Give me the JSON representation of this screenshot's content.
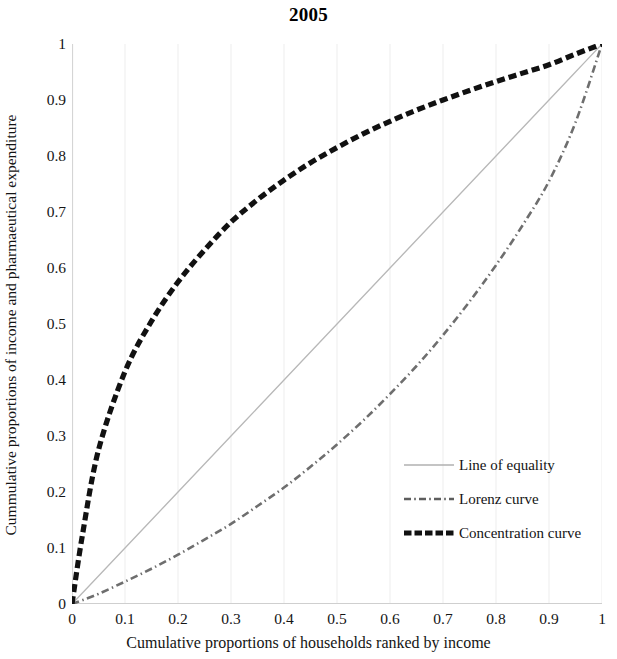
{
  "chart_data": {
    "type": "line",
    "title": "2005",
    "xlabel": "Cumulative  proportions of households ranked by income",
    "ylabel": "Cummulative proportions of income and pharmaeutical expenditure",
    "xlim": [
      0,
      1
    ],
    "ylim": [
      0,
      1
    ],
    "grid": true,
    "legend_position": "inside-lower-right",
    "xticks": [
      "0",
      "0.1",
      "0.2",
      "0.3",
      "0.4",
      "0.5",
      "0.6",
      "0.7",
      "0.8",
      "0.9",
      "1"
    ],
    "yticks": [
      "0",
      "0.1",
      "0.2",
      "0.3",
      "0.4",
      "0.5",
      "0.6",
      "0.7",
      "0.8",
      "0.9",
      "1"
    ],
    "x": [
      0,
      0.02,
      0.05,
      0.1,
      0.15,
      0.2,
      0.25,
      0.3,
      0.35,
      0.4,
      0.45,
      0.5,
      0.55,
      0.6,
      0.65,
      0.7,
      0.75,
      0.8,
      0.85,
      0.9,
      0.95,
      1
    ],
    "series": [
      {
        "name": "Line of equality",
        "style": "solid",
        "color": "#b8b8b8",
        "width": 1.3,
        "values": [
          0,
          0.02,
          0.05,
          0.1,
          0.15,
          0.2,
          0.25,
          0.3,
          0.35,
          0.4,
          0.45,
          0.5,
          0.55,
          0.6,
          0.65,
          0.7,
          0.75,
          0.8,
          0.85,
          0.9,
          0.95,
          1
        ]
      },
      {
        "name": "Lorenz curve",
        "style": "dash-dot",
        "color": "#6e6e6e",
        "width": 2.6,
        "values": [
          0,
          0.007,
          0.018,
          0.04,
          0.063,
          0.088,
          0.115,
          0.143,
          0.175,
          0.208,
          0.245,
          0.285,
          0.328,
          0.375,
          0.425,
          0.48,
          0.54,
          0.605,
          0.676,
          0.755,
          0.86,
          1
        ]
      },
      {
        "name": "Concentration curve",
        "style": "dashed",
        "color": "#111111",
        "width": 5.2,
        "values": [
          0,
          0.125,
          0.275,
          0.415,
          0.505,
          0.575,
          0.632,
          0.682,
          0.722,
          0.757,
          0.788,
          0.815,
          0.84,
          0.862,
          0.882,
          0.9,
          0.917,
          0.933,
          0.948,
          0.963,
          0.982,
          1
        ]
      }
    ]
  },
  "legend": {
    "items": [
      {
        "label": "Line of equality"
      },
      {
        "label": "Lorenz curve"
      },
      {
        "label": "Concentration curve"
      }
    ]
  }
}
